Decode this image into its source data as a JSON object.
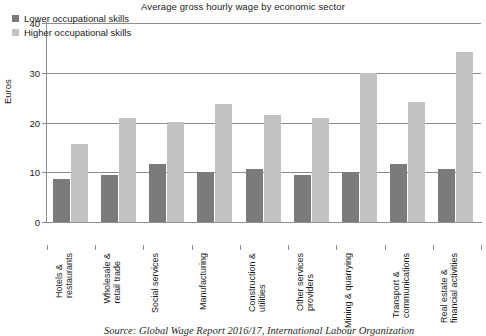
{
  "chart_data": {
    "type": "bar",
    "title": "Average gross hourly wage by economic sector",
    "xlabel": "",
    "ylabel": "Euros",
    "ylim": [
      0,
      40
    ],
    "yticks": [
      0,
      10,
      20,
      30,
      40
    ],
    "grid": true,
    "legend_position": "top-left",
    "source": "Source: Global Wage Report 2016/17, International Labour Organization",
    "categories": [
      "Hotels & restaurants",
      "Wholesale & retail trade",
      "Social services",
      "Manufacturing",
      "Construction & utilities",
      "Other services providers",
      "Mining & quarrying",
      "Transport & communications",
      "Real estate & financial activities"
    ],
    "category_lines": [
      [
        "Hotels &",
        "restaurants"
      ],
      [
        "Wholesale &",
        "retail trade"
      ],
      [
        "Social services",
        ""
      ],
      [
        "Manufacturing",
        ""
      ],
      [
        "Construction &",
        "utilities"
      ],
      [
        "Other services",
        "providers"
      ],
      [
        "Mining & quarrying",
        ""
      ],
      [
        "Transport &",
        "communications"
      ],
      [
        "Real estate &",
        "financial activities"
      ]
    ],
    "series": [
      {
        "name": "Lower occupational skills",
        "color": "#7b7b7b",
        "values": [
          8.6,
          9.5,
          11.7,
          10.1,
          10.6,
          9.5,
          10.1,
          11.7,
          10.7
        ]
      },
      {
        "name": "Higher occupational skills",
        "color": "#c2c2c2",
        "values": [
          15.6,
          21.0,
          20.1,
          23.8,
          21.6,
          21.0,
          30.0,
          24.2,
          34.1
        ]
      }
    ]
  }
}
